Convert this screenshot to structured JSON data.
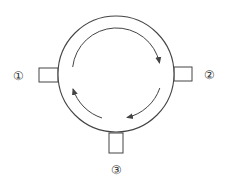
{
  "diagram": {
    "type": "circulator",
    "colors": {
      "stroke": "#444444",
      "label": "#333333",
      "background": "#ffffff"
    },
    "ports": [
      {
        "id": 1,
        "label": "①",
        "position": "left"
      },
      {
        "id": 2,
        "label": "②",
        "position": "right"
      },
      {
        "id": 3,
        "label": "③",
        "position": "bottom"
      }
    ],
    "circulation_direction": "clockwise"
  }
}
